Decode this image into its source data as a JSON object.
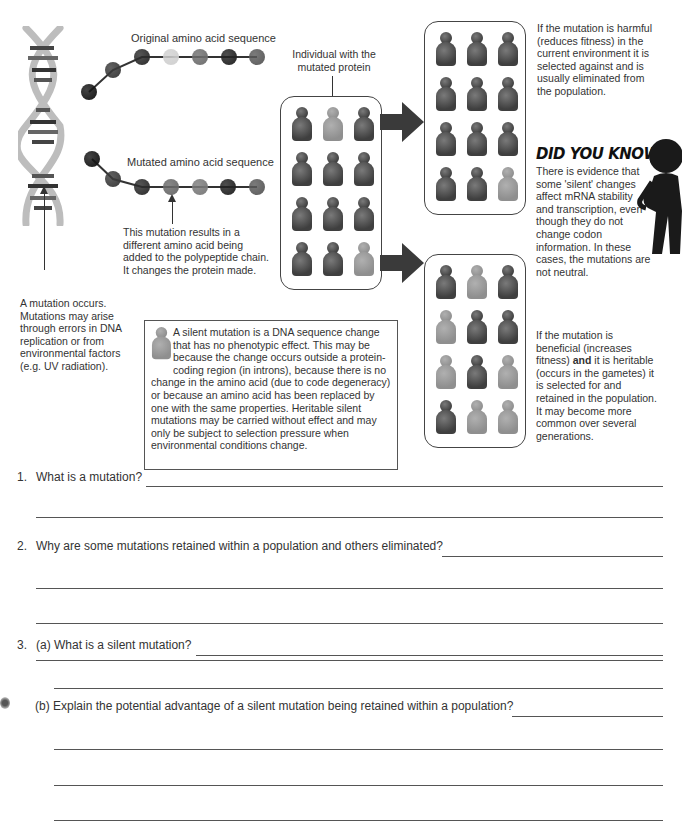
{
  "diagram": {
    "original_sequence_label": "Original amino acid sequence",
    "mutated_sequence_label": "Mutated amino acid sequence",
    "individual_label": "Individual with the mutated protein",
    "mutation_effect_note": "This mutation results in a different amino acid being added to the polypeptide chain. It changes the protein made.",
    "mutation_origin_note": "A mutation occurs. Mutations may arise through errors in DNA replication or from environmental factors (e.g. UV radiation).",
    "harmful_note": "If the mutation is harmful (reduces fitness) in the current environment it is selected against and is usually eliminated from the population.",
    "beneficial_note_part1": "If the mutation is beneficial (increases fitness) ",
    "beneficial_note_bold": "and",
    "beneficial_note_part2": " it is heritable (occurs in the gametes) it is selected for and retained in the population. It may become more common over several generations.",
    "did_you_know": {
      "title": "DID YOU KNOW?",
      "text": "There is evidence that some 'silent' changes affect mRNA stability and transcription, even though they do not change codon information. In these cases, the mutations are not neutral."
    },
    "silent_box_text": "A silent mutation is a DNA sequence change that has no phenotypic effect. This may be because the change occurs outside a protein-coding region (in introns), because there is no change in the amino acid (due to code degeneracy) or because an amino acid has been replaced by one with the same properties. Heritable silent mutations may be carried without effect and may only be subject to selection pressure when environmental conditions change.",
    "original_beads": [
      "#151515",
      "#3a3a3a",
      "#2b2b2b",
      "#d0d0d0",
      "#6e6e6e",
      "#222222",
      "#5a5a5a"
    ],
    "mutated_beads": [
      "#151515",
      "#3a3a3a",
      "#2b2b2b",
      "#6a6a6a",
      "#7a7a7a",
      "#222222",
      "#5a5a5a"
    ],
    "initial_population": [
      "dark",
      "light",
      "dark",
      "dark",
      "dark",
      "dark",
      "dark",
      "dark",
      "dark",
      "dark",
      "dark",
      "light"
    ],
    "harmful_population": [
      "dark",
      "dark",
      "dark",
      "dark",
      "dark",
      "dark",
      "dark",
      "dark",
      "dark",
      "dark",
      "dark",
      "light"
    ],
    "beneficial_population": [
      "dark",
      "light",
      "dark",
      "light",
      "dark",
      "dark",
      "light",
      "dark",
      "light",
      "dark",
      "light",
      "light"
    ]
  },
  "questions": [
    {
      "number": "1.",
      "text": "What is a mutation?"
    },
    {
      "number": "2.",
      "text": "Why are some mutations retained within a population and others eliminated?"
    },
    {
      "number": "3.",
      "text": "(a) What is a silent mutation?"
    },
    {
      "number": "",
      "text": "(b) Explain the potential advantage of a silent mutation being retained within a population?"
    }
  ]
}
